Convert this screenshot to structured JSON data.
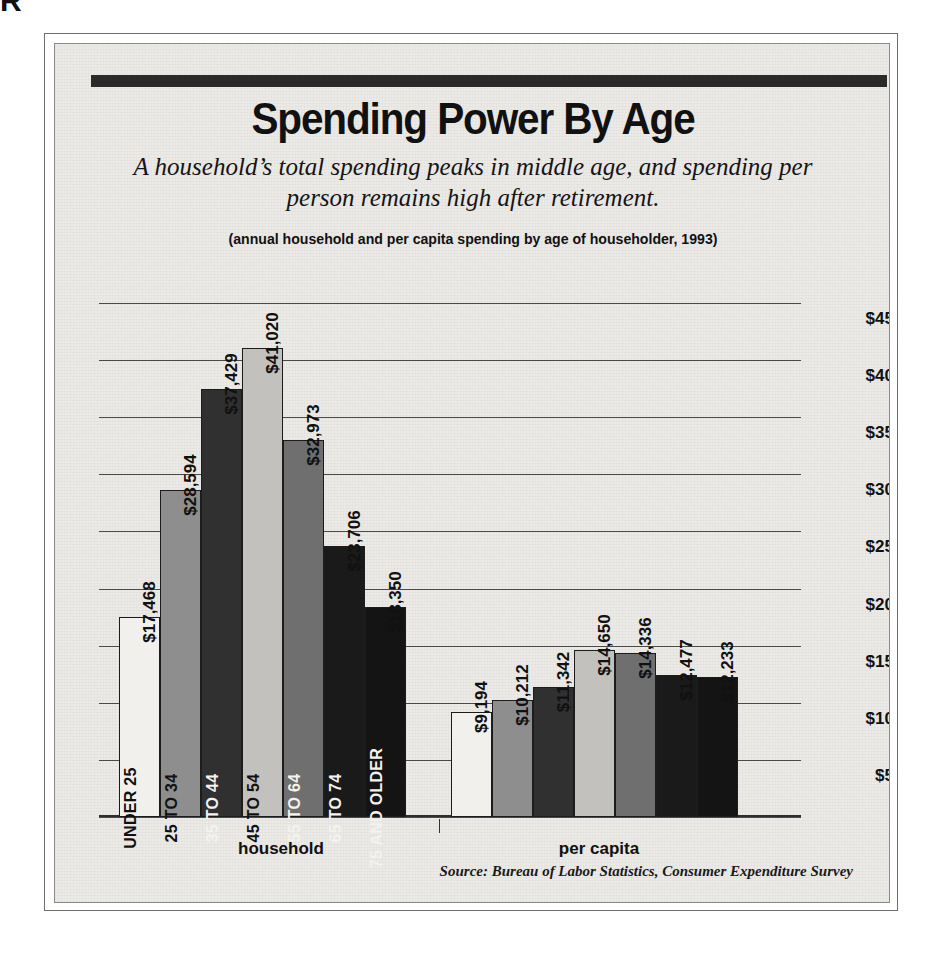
{
  "corner_fragment": "R",
  "header": {
    "title": "Spending Power By Age",
    "subtitle": "A household’s total spending peaks in middle age, and spending per person remains high after retirement.",
    "note": "(annual household and per capita spending by age of householder, 1993)"
  },
  "source": "Source: Bureau of Labor Statistics, Consumer Expenditure Survey",
  "groups": {
    "household_label": "household",
    "percapita_label": "per capita"
  },
  "axis": {
    "ticks": [
      "$45,000",
      "$40,000",
      "$35,000",
      "$30,000",
      "$25,000",
      "$20,000",
      "$15,000",
      "$10,000",
      "$5,000",
      "$0"
    ]
  },
  "chart_data": {
    "type": "bar",
    "title": "Spending Power By Age",
    "subtitle": "A household’s total spending peaks in middle age, and spending per person remains high after retirement.",
    "note": "(annual household and per capita spending by age of householder, 1993)",
    "source": "Source: Bureau of Labor Statistics, Consumer Expenditure Survey",
    "xlabel": "",
    "ylabel": "",
    "ylim": [
      0,
      45000
    ],
    "ytick_step": 5000,
    "ytick_labels": [
      "$0",
      "$5,000",
      "$10,000",
      "$15,000",
      "$20,000",
      "$25,000",
      "$30,000",
      "$35,000",
      "$40,000",
      "$45,000"
    ],
    "grid": true,
    "axis_side": "right",
    "legend": "none",
    "categories": [
      "UNDER 25",
      "25 TO 34",
      "35 TO 44",
      "45 TO 54",
      "55 TO 64",
      "65 TO 74",
      "75 AND OLDER"
    ],
    "groups": [
      "household",
      "per capita"
    ],
    "series": [
      {
        "name": "household",
        "values": [
          17468,
          28594,
          37429,
          41020,
          32973,
          23706,
          18350
        ],
        "labels": [
          "$17,468",
          "$28,594",
          "$37,429",
          "$41,020",
          "$32,973",
          "$23,706",
          "$18,350"
        ]
      },
      {
        "name": "per capita",
        "values": [
          9194,
          10212,
          11342,
          14650,
          14336,
          12477,
          12233
        ],
        "labels": [
          "$9,194",
          "$10,212",
          "$11,342",
          "$14,650",
          "$14,336",
          "$12,477",
          "$12,233"
        ]
      }
    ],
    "bar_fills": [
      "#f2f0ec",
      "#8e8e8e",
      "#303030",
      "#c3c1bd",
      "#6f6f6f",
      "#1a1a1a",
      "#141414"
    ]
  }
}
